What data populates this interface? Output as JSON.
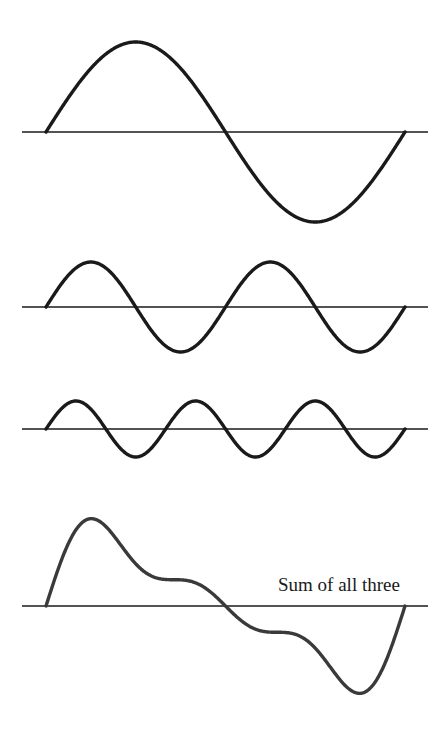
{
  "chart_data": {
    "type": "line",
    "title": "",
    "axes": {
      "x_start": 22,
      "x_end": 428,
      "wave_x_start": 46,
      "wave_x_end": 405
    },
    "series": [
      {
        "name": "wave-1",
        "cycles": 1,
        "amplitude": 90,
        "baseline_y": 132,
        "color": "#1a1a1a"
      },
      {
        "name": "wave-2",
        "cycles": 2,
        "amplitude": 45,
        "baseline_y": 307,
        "color": "#1a1a1a"
      },
      {
        "name": "wave-3",
        "cycles": 3,
        "amplitude": 28,
        "baseline_y": 429,
        "color": "#1a1a1a"
      },
      {
        "name": "sum",
        "label": "Sum of all three",
        "baseline_y": 606,
        "scale": 0.68,
        "color": "#3a3a3a"
      }
    ],
    "annotations": [
      "Sum of all three"
    ]
  },
  "labels": {
    "sum": "Sum of all three"
  }
}
